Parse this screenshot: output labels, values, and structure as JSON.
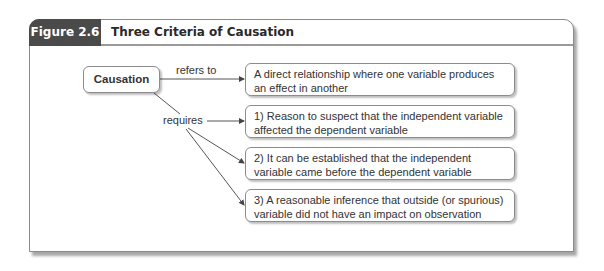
{
  "figure": {
    "label": "Figure 2.6",
    "title": "Three Criteria of Causation"
  },
  "diagram": {
    "root": "Causation",
    "edges": {
      "refers_to": "refers to",
      "requires": "requires"
    },
    "definition": "A direct relationship where one variable produces an effect in another",
    "criteria": [
      "1) Reason to suspect that the independent variable affected the dependent variable",
      "2) It can be established that the independent variable came before the dependent variable",
      "3) A reasonable inference that outside (or spurious) variable did not have an impact on observation"
    ]
  },
  "colors": {
    "label_bg": "#4a4a4a",
    "border": "#8c8c8c",
    "text": "#333333"
  }
}
